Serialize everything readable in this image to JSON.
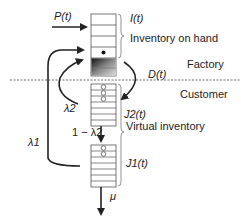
{
  "diagram": {
    "labels": {
      "production_rate": "P(t)",
      "inventory_level": "I(t)",
      "inventory_on_hand": "Inventory on hand",
      "factory": "Factory",
      "customer": "Customer",
      "demand": "D(t)",
      "lambda2": "λ2",
      "one_minus_lambda2": "1 − λ2",
      "lambda1": "λ1",
      "queue2": "J2(t)",
      "queue1": "J1(t)",
      "virtual_inventory": "Virtual inventory",
      "service_rate": "μ"
    },
    "stacks": {
      "inventory_rows": 4,
      "queue2_rows": 7,
      "queue1_rows": 7,
      "queue2_circles": 3,
      "queue1_circles": 2
    },
    "colors": {
      "line": "#222222",
      "stack_border": "#555555",
      "divider": "#444444"
    }
  }
}
